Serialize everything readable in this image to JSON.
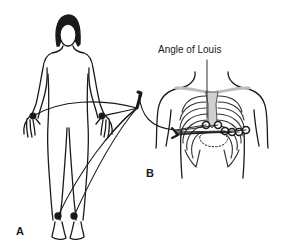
{
  "figure": {
    "panels": [
      {
        "id": "A",
        "label": "A",
        "description": "Full body figure with limb lead electrodes at wrists and ankles, cables converging to a connector"
      },
      {
        "id": "B",
        "label": "B",
        "description": "Chest wall with rib cage showing precordial electrode positions"
      }
    ],
    "annotations": [
      {
        "text": "Angle of Louis",
        "points_to": "sternal angle"
      }
    ],
    "colors": {
      "line": "#1a1a1a",
      "sternum": "#cfcfcf",
      "background": "#ffffff"
    }
  }
}
